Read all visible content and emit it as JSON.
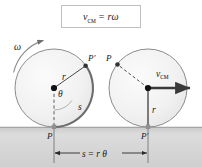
{
  "figure": {
    "title_formula": {
      "v_symbol": "v",
      "v_subscript": "CM",
      "equals": "=",
      "rhs": "rω"
    },
    "left_wheel": {
      "omega_label": "ω",
      "radius_label": "r",
      "theta_label": "θ",
      "arc_label": "s",
      "point_top_label": "P′",
      "point_ground_label": "P"
    },
    "right_wheel": {
      "point_top_label": "P",
      "velocity_symbol": "v",
      "velocity_subscript": "CM",
      "radius_label": "r",
      "point_ground_label": "P′"
    },
    "dimension": {
      "label_s": "s",
      "label_equals": "=",
      "label_rtheta": "r θ"
    },
    "colors": {
      "ink": "#1a1a1a",
      "circle_stroke": "#8c8c8c",
      "circle_fill": "#f2f2f2",
      "arc_highlight": "#6e6e6e",
      "ground_top": "#b4b4b4",
      "ground_fill": "#d9d9d9",
      "box_border": "#bfbfbf",
      "page_bg": "#ffffff"
    }
  }
}
